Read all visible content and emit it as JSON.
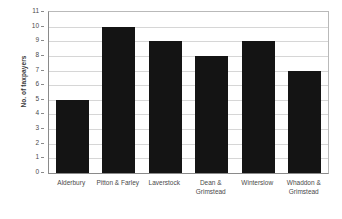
{
  "chart_data": {
    "type": "bar",
    "title": "",
    "xlabel": "",
    "ylabel": "No. of taxpayers",
    "categories": [
      "Alderbury",
      "Pitton & Farley",
      "Laverstock",
      "Dean &\nGrimstead",
      "Winterslow",
      "Whaddon &\nGrimstead"
    ],
    "values": [
      5,
      10,
      9,
      8,
      9,
      7
    ],
    "ylim": [
      0,
      11
    ],
    "ytick_labels": [
      "0",
      "1",
      "2",
      "3",
      "4",
      "5",
      "6",
      "7",
      "8",
      "9",
      "10",
      "11"
    ],
    "ytick_values": [
      0,
      1,
      2,
      3,
      4,
      5,
      6,
      7,
      8,
      9,
      10,
      11
    ],
    "grid": true,
    "legend": "none",
    "bar_color": "#141414",
    "grid_color": "#d6d6d6",
    "axis_color": "#8a8a8a",
    "background": "#ffffff"
  }
}
